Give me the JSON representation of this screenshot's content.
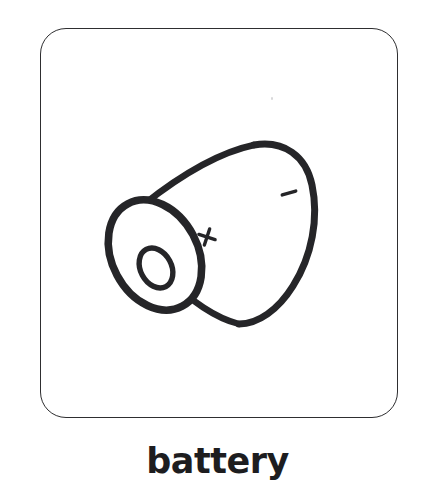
{
  "card": {
    "label": "battery",
    "background_color": "#ffffff",
    "border_color": "#2e2e30",
    "corner_radius_px": 26
  },
  "caption": {
    "text": "battery",
    "color": "#1d1d1f"
  },
  "illustration": {
    "name": "battery",
    "style": "black outline line drawing",
    "view": "isometric three-quarter, tilted cylinder",
    "stroke_color": "#252528",
    "fill_color": "#ffffff",
    "object_type": "cylindrical dry cell battery",
    "markings": {
      "positive_symbol": "+",
      "negative_symbol": "–"
    },
    "parts": [
      "positive terminal nub",
      "front end rim ellipse",
      "cylinder body",
      "negative end cap"
    ]
  }
}
